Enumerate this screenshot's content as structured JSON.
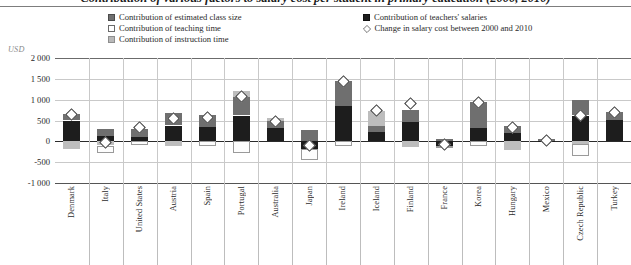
{
  "chart": {
    "title": "Contribution of various factors to salary cost per student in primary education (2000, 2010)",
    "unit_label": "USD",
    "legend": [
      {
        "key": "class_size",
        "icon": "filled-square-gray",
        "label": "Contribution of estimated class size"
      },
      {
        "key": "teaching",
        "icon": "open-square",
        "label": "Contribution of teaching time"
      },
      {
        "key": "instruction",
        "icon": "filled-square-light",
        "label": "Contribution of instruction time"
      },
      {
        "key": "salaries",
        "icon": "filled-square-black",
        "label": "Contribution of teachers' salaries"
      },
      {
        "key": "change",
        "icon": "open-diamond",
        "label": "Change in salary cost between 2000 and 2010"
      }
    ],
    "colors": {
      "class_size": "#6f6f6f",
      "salaries": "#1d1d1d",
      "teaching": "#ffffff",
      "instruction": "#bdbdbd",
      "change_marker": "#ffffff",
      "zero_line": "#2b2b2b",
      "grid": "#c9c9c9"
    }
  },
  "chart_data": {
    "type": "bar",
    "subtype": "stacked-waterfall-with-marker",
    "title": "Contribution of various factors to salary cost per student in primary education (2000, 2010)",
    "xlabel": "",
    "ylabel": "USD",
    "ylim": [
      -1000,
      2000
    ],
    "yticks": [
      2000,
      1500,
      1000,
      500,
      0,
      -500,
      -1000
    ],
    "ytick_labels": [
      "2 000",
      "1 500",
      "1 000",
      "500",
      "0",
      "-500",
      "-1 000"
    ],
    "grid": true,
    "legend_position": "top",
    "categories": [
      "Denmark",
      "Italy",
      "United States",
      "Austria",
      "Spain",
      "Portugal",
      "Australia",
      "Japan",
      "Ireland",
      "Iceland",
      "Finland",
      "France",
      "Korea",
      "Hungary",
      "Mexico",
      "Czech Republic",
      "Turkey"
    ],
    "series": [
      {
        "name": "Contribution of teachers' salaries",
        "key": "salaries",
        "color": "#1d1d1d",
        "values": [
          500,
          130,
          100,
          380,
          350,
          620,
          320,
          -180,
          840,
          230,
          470,
          -110,
          330,
          190,
          20,
          620,
          520
        ]
      },
      {
        "name": "Contribution of instruction time",
        "key": "instruction",
        "color": "#bdbdbd",
        "values": [
          -190,
          -100,
          0,
          -110,
          0,
          150,
          60,
          0,
          0,
          360,
          -130,
          0,
          0,
          -200,
          0,
          -70,
          0
        ]
      },
      {
        "name": "Contribution of teaching time",
        "key": "teaching",
        "color": "#ffffff",
        "values": [
          0,
          -180,
          -80,
          0,
          -110,
          -270,
          0,
          -280,
          -120,
          0,
          0,
          -50,
          -120,
          0,
          0,
          -290,
          0
        ]
      },
      {
        "name": "Contribution of estimated class size",
        "key": "class_size",
        "color": "#6f6f6f",
        "values": [
          160,
          160,
          200,
          290,
          280,
          440,
          180,
          280,
          610,
          140,
          290,
          60,
          620,
          180,
          30,
          380,
          180
        ]
      }
    ],
    "markers": {
      "name": "Change in salary cost between 2000 and 2010",
      "symbol": "open-diamond",
      "values": [
        640,
        -30,
        330,
        560,
        580,
        1070,
        480,
        -100,
        1430,
        730,
        900,
        -70,
        940,
        340,
        30,
        620,
        700
      ]
    }
  }
}
